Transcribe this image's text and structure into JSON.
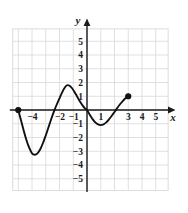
{
  "chart_data": {
    "type": "line",
    "title": "",
    "xlabel": "x",
    "ylabel": "y",
    "xlim": [
      -6,
      6
    ],
    "ylim": [
      -6,
      6
    ],
    "grid": true,
    "legend": null,
    "x_ticks": [
      -4,
      -2,
      -1,
      1,
      3,
      4,
      5
    ],
    "x_tick_labels": [
      "-4",
      "-2",
      "-1",
      "1",
      "3",
      "4",
      "5"
    ],
    "y_ticks": [
      5,
      4,
      3,
      2,
      1,
      -1,
      -2,
      -3,
      -4,
      -5
    ],
    "y_tick_labels": [
      "5",
      "4",
      "3",
      "2",
      "1",
      "-1",
      "-2",
      "-3",
      "-4",
      "-5"
    ],
    "curve_color": "#111111",
    "grid_color": "#d8d8dc",
    "axis_color": "#1a1a1a",
    "series": [
      {
        "name": "f(x)",
        "points": [
          [
            -5.0,
            0.0
          ],
          [
            -4.8,
            -0.75
          ],
          [
            -4.6,
            -1.5
          ],
          [
            -4.4,
            -2.2
          ],
          [
            -4.2,
            -2.75
          ],
          [
            -4.0,
            -3.15
          ],
          [
            -3.8,
            -3.25
          ],
          [
            -3.6,
            -3.15
          ],
          [
            -3.4,
            -2.85
          ],
          [
            -3.2,
            -2.4
          ],
          [
            -3.0,
            -1.85
          ],
          [
            -2.8,
            -1.25
          ],
          [
            -2.6,
            -0.65
          ],
          [
            -2.4,
            -0.1
          ],
          [
            -2.2,
            0.4
          ],
          [
            -2.0,
            0.85
          ],
          [
            -1.8,
            1.3
          ],
          [
            -1.6,
            1.65
          ],
          [
            -1.45,
            1.8
          ],
          [
            -1.3,
            1.78
          ],
          [
            -1.1,
            1.6
          ],
          [
            -0.9,
            1.3
          ],
          [
            -0.7,
            0.95
          ],
          [
            -0.5,
            0.6
          ],
          [
            -0.3,
            0.3
          ],
          [
            -0.15,
            0.12
          ],
          [
            0.0,
            0.0
          ],
          [
            0.2,
            -0.35
          ],
          [
            0.4,
            -0.65
          ],
          [
            0.6,
            -0.9
          ],
          [
            0.8,
            -1.05
          ],
          [
            1.0,
            -1.1
          ],
          [
            1.2,
            -1.05
          ],
          [
            1.4,
            -0.9
          ],
          [
            1.6,
            -0.68
          ],
          [
            1.8,
            -0.42
          ],
          [
            2.0,
            -0.15
          ],
          [
            2.2,
            0.15
          ],
          [
            2.4,
            0.42
          ],
          [
            2.6,
            0.65
          ],
          [
            2.8,
            0.85
          ],
          [
            3.0,
            1.0
          ]
        ]
      }
    ],
    "endpoints": [
      {
        "name": "left-endpoint",
        "x": -5.0,
        "y": 0.0,
        "filled": true
      },
      {
        "name": "right-endpoint",
        "x": 3.0,
        "y": 1.0,
        "filled": true
      }
    ],
    "features": [
      {
        "name": "local-minimum-left",
        "x": -3.8,
        "y": -3.25
      },
      {
        "name": "local-maximum",
        "x": -1.45,
        "y": 1.8
      },
      {
        "name": "local-minimum-right",
        "x": 1.0,
        "y": -1.1
      },
      {
        "name": "origin-crossing",
        "x": 0.0,
        "y": 0.0
      }
    ]
  }
}
